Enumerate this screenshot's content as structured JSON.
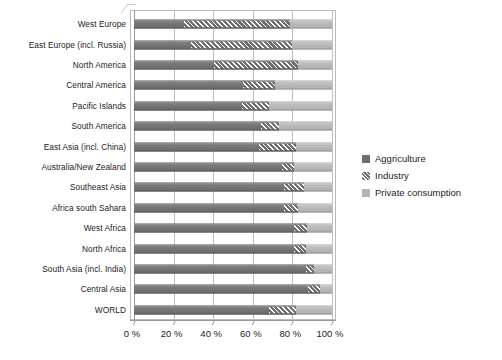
{
  "chart_data": {
    "type": "bar",
    "subtype": "stacked-horizontal-100",
    "title": "",
    "xlabel": "",
    "ylabel": "",
    "xlim": [
      0,
      100
    ],
    "xticks": [
      "0 %",
      "20 %",
      "40 %",
      "60 %",
      "80 %",
      "100 %"
    ],
    "xtick_values": [
      0,
      20,
      40,
      60,
      80,
      100
    ],
    "grid": true,
    "legend_position": "right",
    "categories": [
      "West Europe",
      "East Europe (incl. Russia)",
      "North America",
      "Central America",
      "Pacific Islands",
      "South America",
      "East Asia (incl. China)",
      "Australia/New Zealand",
      "Southeast Asia",
      "Africa south Sahara",
      "West Africa",
      "North Africa",
      "South Asia (incl. India)",
      "Central Asia",
      "WORLD"
    ],
    "series": [
      {
        "name": "Aggriculture",
        "color": "#6e6e6e",
        "pattern": "solid",
        "values": [
          25,
          29,
          40.5,
          55,
          54.5,
          64,
          63,
          74.5,
          76,
          76,
          81,
          81,
          87,
          88,
          68
        ]
      },
      {
        "name": "Industry",
        "color": "#6f6f6f",
        "pattern": "hatched",
        "values": [
          54,
          51,
          42.5,
          16,
          13.5,
          9,
          19,
          6.5,
          10,
          7,
          6.5,
          6,
          4,
          6,
          14
        ]
      },
      {
        "name": "Private consumption",
        "color": "#b4b4b4",
        "pattern": "solid-light",
        "values": [
          21,
          20,
          17,
          29,
          32,
          27,
          18,
          19,
          14,
          17,
          12.5,
          13,
          9,
          6,
          18
        ]
      }
    ]
  },
  "legend": {
    "items": [
      {
        "label": "Aggriculture",
        "swatch": "legend-swatch-agriculture"
      },
      {
        "label": "Industry",
        "swatch": "legend-swatch-industry"
      },
      {
        "label": "Private consumption",
        "swatch": "legend-swatch-private-consumption"
      }
    ]
  },
  "colors": {
    "agriculture": "#6e6e6e",
    "industry": "#6f6f6f",
    "private_consumption": "#b4b4b4",
    "gridline": "#bdbdbd",
    "axis": "#9a9a9a",
    "text": "#1c1c1c",
    "background": "#ffffff"
  }
}
